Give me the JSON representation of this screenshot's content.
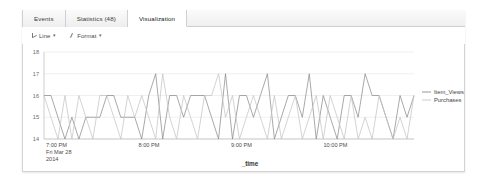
{
  "tabs": [
    {
      "label": "Events",
      "active": false
    },
    {
      "label": "Statistics (48)",
      "active": false
    },
    {
      "label": "Visualization",
      "active": true
    }
  ],
  "toolbar": {
    "chart_type_label": "Line",
    "format_label": "Format",
    "caret": "▾"
  },
  "chart_data": {
    "type": "line",
    "title": "",
    "xlabel": "_time",
    "ylabel": "",
    "ylim": [
      14,
      18
    ],
    "yticks": [
      18,
      17,
      16,
      15,
      14
    ],
    "grid": true,
    "legend_position": "right",
    "xtick_labels": [
      {
        "time": "7:00 PM",
        "date": "Fri Mar 28",
        "year": "2014"
      },
      {
        "time": "8:00 PM",
        "date": "",
        "year": ""
      },
      {
        "time": "9:00 PM",
        "date": "",
        "year": ""
      },
      {
        "time": "10:00 PM",
        "date": "",
        "year": ""
      }
    ],
    "series": [
      {
        "name": "Item_Views",
        "color": "#8c8c8c",
        "values": [
          16,
          16,
          15,
          14,
          15,
          14,
          15,
          15,
          15,
          16,
          16,
          15,
          15,
          15,
          14,
          16,
          17,
          14,
          16,
          16,
          15,
          16,
          16,
          16,
          15,
          14,
          17,
          14,
          16,
          16,
          15,
          16,
          17,
          14,
          15,
          16,
          16,
          15,
          17,
          14,
          16,
          15,
          14,
          16,
          16,
          15,
          17,
          16,
          16,
          15,
          14,
          16,
          15,
          16
        ]
      },
      {
        "name": "Purchases",
        "color": "#c4c4c4",
        "values": [
          16,
          15,
          14,
          16,
          14,
          16,
          15,
          14,
          16,
          16,
          15,
          14,
          16,
          15,
          16,
          15,
          14,
          17,
          15,
          14,
          16,
          15,
          14,
          16,
          16,
          17,
          15,
          16,
          14,
          15,
          16,
          15,
          14,
          16,
          14,
          15,
          16,
          14,
          15,
          16,
          14,
          16,
          15,
          14,
          16,
          14,
          15,
          14,
          16,
          15,
          14,
          15,
          14,
          16
        ]
      }
    ]
  }
}
